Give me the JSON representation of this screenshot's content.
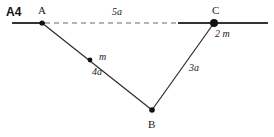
{
  "figure": {
    "problem_number": "A4",
    "type": "mechanics-geometry-diagram",
    "background_color": "#ffffff",
    "line_color": "#333333",
    "points": [
      {
        "id": "A",
        "label": "A",
        "x": 42,
        "y": 23,
        "dot_radius": 2.6,
        "mass": null
      },
      {
        "id": "B",
        "label": "B",
        "x": 152,
        "y": 110,
        "dot_radius": 2.8,
        "mass": null
      },
      {
        "id": "C",
        "label": "C",
        "x": 214,
        "y": 23,
        "dot_radius": 4.0,
        "mass": "2 m"
      },
      {
        "id": "m",
        "label": "",
        "x": 90,
        "y": 60,
        "dot_radius": 2.4,
        "mass": "m"
      }
    ],
    "segments": [
      {
        "id": "AB",
        "from": "A",
        "to": "B",
        "style": "solid",
        "length_label": "4a"
      },
      {
        "id": "BC",
        "from": "B",
        "to": "C",
        "style": "solid",
        "length_label": "3a"
      },
      {
        "id": "AC",
        "from": "A",
        "to": "C",
        "style": "dashed",
        "length_label": "5a"
      }
    ],
    "rails": [
      {
        "id": "left-rail",
        "x1": 12,
        "x2": 45,
        "y": 23,
        "style": "solid"
      },
      {
        "id": "right-rail",
        "x1": 178,
        "x2": 268,
        "y": 23,
        "style": "solid"
      }
    ],
    "labels": {
      "point_a": "A",
      "point_b": "B",
      "point_c": "C",
      "mass_m": "m",
      "mass_2m": "2 m",
      "length_ab": "4a",
      "length_bc": "3a",
      "length_ac": "5a"
    }
  }
}
